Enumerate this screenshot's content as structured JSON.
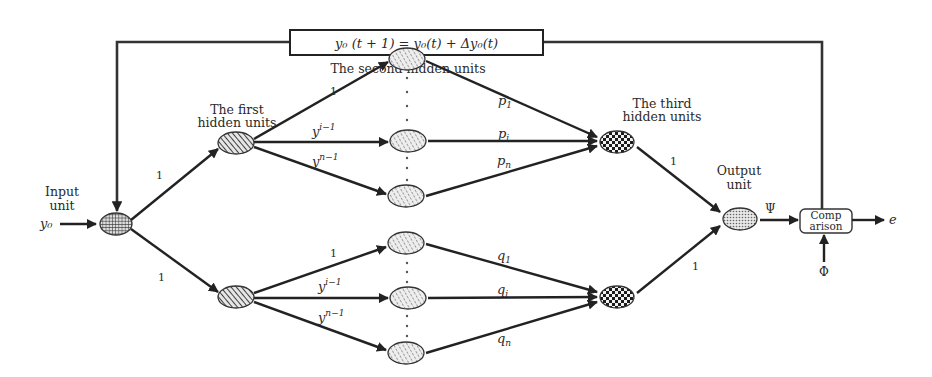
{
  "diagram": {
    "formula_box": "y₀ (t + 1) = y₀(t) + Δy₀(t)",
    "layers": {
      "input": {
        "label_line1": "Input",
        "label_line2": "unit",
        "input_signal": "y₀"
      },
      "first_hidden": {
        "label_line1": "The first",
        "label_line2": "hidden units"
      },
      "second_hidden": {
        "label": "The second hidden units"
      },
      "third_hidden": {
        "label_line1": "The third",
        "label_line2": "hidden units"
      },
      "output": {
        "label_line1": "Output",
        "label_line2": "unit",
        "signal": "Ψ"
      }
    },
    "comparison": {
      "line1": "Comp",
      "line2": "arison",
      "reference": "Φ",
      "error": "e"
    },
    "weights": {
      "input_to_first_top": "1",
      "input_to_first_bottom": "1",
      "upper_branch": {
        "w1": "1",
        "wi_base": "y",
        "wi_exp": "i−1",
        "wn_base": "y",
        "wn_exp": "n−1"
      },
      "lower_branch": {
        "w1": "1",
        "wi_base": "y",
        "wi_exp": "i−1",
        "wn_base": "y",
        "wn_exp": "n−1"
      },
      "p": {
        "p1": "p",
        "p1_sub": "1",
        "pi": "p",
        "pi_sub": "i",
        "pn": "p",
        "pn_sub": "n"
      },
      "q": {
        "q1": "q",
        "q1_sub": "1",
        "qi": "q",
        "qi_sub": "i",
        "qn": "q",
        "qn_sub": "n"
      },
      "third_to_output_top": "1",
      "third_to_output_bottom": "1"
    }
  }
}
